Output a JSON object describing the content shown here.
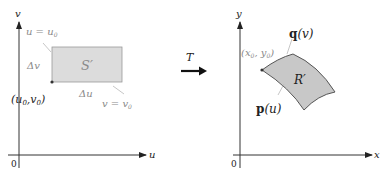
{
  "left_panel": {
    "axis_x_label": "u",
    "axis_y_label": "v",
    "origin_label": "0",
    "region_label": "S′",
    "line_label_u": "u = u",
    "line_label_u_sub": "0",
    "line_label_v": "v = v",
    "line_label_v_sub": "0",
    "delta_v_label": "Δv",
    "delta_u_label": "Δu",
    "corner_point_label": "(u",
    "corner_point_sub1": "0",
    "corner_point_mid": ",v",
    "corner_point_sub2": "0",
    "corner_point_end": ")"
  },
  "transform": {
    "label": "T"
  },
  "right_panel": {
    "axis_x_label": "x",
    "axis_y_label": "y",
    "origin_label": "0",
    "region_label": "R′",
    "curve_q_label_bold": "q",
    "curve_q_label_arg": "(v)",
    "curve_p_label_bold": "p",
    "curve_p_label_arg": "(u)",
    "corner_point_label": "(x",
    "corner_point_sub1": "0",
    "corner_point_mid": ", y",
    "corner_point_sub2": "0",
    "corner_point_end": ")"
  },
  "colors": {
    "region_fill_left": "#dcdcdc",
    "region_fill_right": "#c8c8c8",
    "axis": "#333333",
    "leader": "#b0b0b0"
  }
}
